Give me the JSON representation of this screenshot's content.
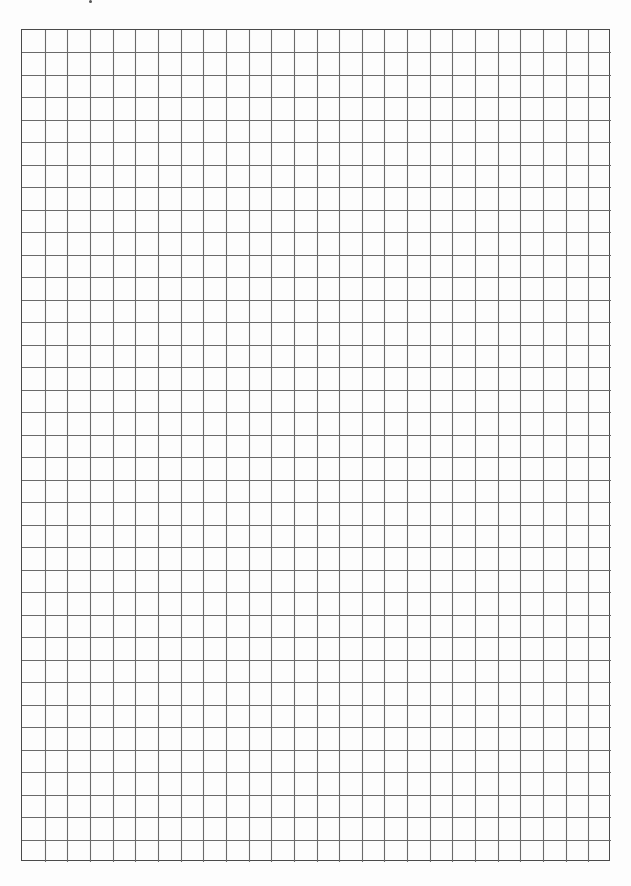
{
  "page": {
    "type": "graph-paper",
    "background_color": "#ffffff",
    "line_color": "#6a6a6a",
    "border_color": "#4a4a4a"
  },
  "grid": {
    "left": 21,
    "top": 29,
    "width": 589,
    "height": 832,
    "columns": 26,
    "rows": 37
  }
}
